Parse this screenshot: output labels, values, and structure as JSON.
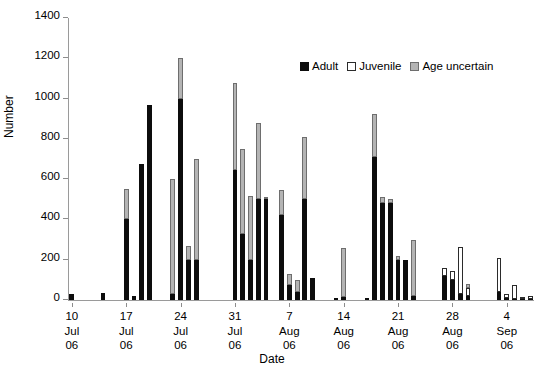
{
  "chart_data": {
    "type": "bar",
    "title": "",
    "subtitle": "",
    "xlabel": "Date",
    "ylabel": "Number",
    "ylim": [
      0,
      1400
    ],
    "ytick_step": 200,
    "yticks": [
      0,
      200,
      400,
      600,
      800,
      1000,
      1200,
      1400
    ],
    "grid": false,
    "stacked": true,
    "legend_position": "top-right-inside",
    "legend": [
      "Adult",
      "Juvenile",
      "Age uncertain"
    ],
    "colors": {
      "adult": "#0d0d0d",
      "juvenile": "#ffffff",
      "age_uncertain": "#b4b4b4",
      "outline": "#2b2b2b",
      "axis": "#9a9a9a"
    },
    "xtick_labels": [
      {
        "day": "10",
        "month": "Jul",
        "year": "06"
      },
      {
        "day": "17",
        "month": "Jul",
        "year": "06"
      },
      {
        "day": "24",
        "month": "Jul",
        "year": "06"
      },
      {
        "day": "31",
        "month": "Jul",
        "year": "06"
      },
      {
        "day": "7",
        "month": "Aug",
        "year": "06"
      },
      {
        "day": "14",
        "month": "Aug",
        "year": "06"
      },
      {
        "day": "21",
        "month": "Aug",
        "year": "06"
      },
      {
        "day": "28",
        "month": "Aug",
        "year": "06"
      },
      {
        "day": "4",
        "month": "Sep",
        "year": "06"
      }
    ],
    "xtick_indices": [
      0,
      7,
      14,
      21,
      28,
      35,
      42,
      49,
      56
    ],
    "series": [
      {
        "name": "Adult",
        "key": "adult"
      },
      {
        "name": "Juvenile",
        "key": "juvenile"
      },
      {
        "name": "Age uncertain",
        "key": "age_uncertain"
      }
    ],
    "categories": [
      "10 Jul",
      "11 Jul",
      "12 Jul",
      "13 Jul",
      "14 Jul",
      "15 Jul",
      "16 Jul",
      "17 Jul",
      "18 Jul",
      "19 Jul",
      "20 Jul",
      "21 Jul",
      "22 Jul",
      "23 Jul",
      "24 Jul",
      "25 Jul",
      "26 Jul",
      "27 Jul",
      "28 Jul",
      "29 Jul",
      "30 Jul",
      "31 Jul",
      "1 Aug",
      "2 Aug",
      "3 Aug",
      "4 Aug",
      "5 Aug",
      "6 Aug",
      "7 Aug",
      "8 Aug",
      "9 Aug",
      "10 Aug",
      "11 Aug",
      "12 Aug",
      "13 Aug",
      "14 Aug",
      "15 Aug",
      "16 Aug",
      "17 Aug",
      "18 Aug",
      "19 Aug",
      "20 Aug",
      "21 Aug",
      "22 Aug",
      "23 Aug",
      "24 Aug",
      "25 Aug",
      "26 Aug",
      "27 Aug",
      "28 Aug",
      "29 Aug",
      "30 Aug",
      "31 Aug",
      "1 Sep",
      "2 Sep",
      "3 Sep",
      "4 Sep",
      "5 Sep",
      "6 Sep"
    ],
    "bars": [
      {
        "x": "10 Jul",
        "adult": 30,
        "juvenile": 0,
        "age_uncertain": 0,
        "total": 30
      },
      {
        "x": "11 Jul",
        "adult": 0,
        "juvenile": 0,
        "age_uncertain": 0,
        "total": 0
      },
      {
        "x": "12 Jul",
        "adult": 0,
        "juvenile": 0,
        "age_uncertain": 0,
        "total": 0
      },
      {
        "x": "13 Jul",
        "adult": 0,
        "juvenile": 0,
        "age_uncertain": 0,
        "total": 0
      },
      {
        "x": "14 Jul",
        "adult": 35,
        "juvenile": 0,
        "age_uncertain": 0,
        "total": 35
      },
      {
        "x": "15 Jul",
        "adult": 0,
        "juvenile": 0,
        "age_uncertain": 0,
        "total": 0
      },
      {
        "x": "16 Jul",
        "adult": 0,
        "juvenile": 0,
        "age_uncertain": 0,
        "total": 0
      },
      {
        "x": "17 Jul",
        "adult": 400,
        "juvenile": 0,
        "age_uncertain": 150,
        "total": 550
      },
      {
        "x": "18 Jul",
        "adult": 20,
        "juvenile": 0,
        "age_uncertain": 0,
        "total": 20
      },
      {
        "x": "19 Jul",
        "adult": 675,
        "juvenile": 0,
        "age_uncertain": 0,
        "total": 675
      },
      {
        "x": "20 Jul",
        "adult": 970,
        "juvenile": 0,
        "age_uncertain": 0,
        "total": 970
      },
      {
        "x": "21 Jul",
        "adult": 0,
        "juvenile": 0,
        "age_uncertain": 0,
        "total": 0
      },
      {
        "x": "22 Jul",
        "adult": 0,
        "juvenile": 0,
        "age_uncertain": 0,
        "total": 0
      },
      {
        "x": "23 Jul",
        "adult": 30,
        "juvenile": 0,
        "age_uncertain": 570,
        "total": 600
      },
      {
        "x": "24 Jul",
        "adult": 1000,
        "juvenile": 0,
        "age_uncertain": 200,
        "total": 1200
      },
      {
        "x": "25 Jul",
        "adult": 200,
        "juvenile": 0,
        "age_uncertain": 70,
        "total": 270
      },
      {
        "x": "26 Jul",
        "adult": 200,
        "juvenile": 0,
        "age_uncertain": 500,
        "total": 700
      },
      {
        "x": "27 Jul",
        "adult": 0,
        "juvenile": 0,
        "age_uncertain": 0,
        "total": 0
      },
      {
        "x": "28 Jul",
        "adult": 0,
        "juvenile": 0,
        "age_uncertain": 0,
        "total": 0
      },
      {
        "x": "29 Jul",
        "adult": 0,
        "juvenile": 0,
        "age_uncertain": 0,
        "total": 0
      },
      {
        "x": "30 Jul",
        "adult": 0,
        "juvenile": 0,
        "age_uncertain": 0,
        "total": 0
      },
      {
        "x": "31 Jul",
        "adult": 645,
        "juvenile": 0,
        "age_uncertain": 430,
        "total": 1075
      },
      {
        "x": "1 Aug",
        "adult": 330,
        "juvenile": 0,
        "age_uncertain": 420,
        "total": 750
      },
      {
        "x": "2 Aug",
        "adult": 200,
        "juvenile": 0,
        "age_uncertain": 315,
        "total": 515
      },
      {
        "x": "3 Aug",
        "adult": 500,
        "juvenile": 0,
        "age_uncertain": 380,
        "total": 880
      },
      {
        "x": "4 Aug",
        "adult": 500,
        "juvenile": 0,
        "age_uncertain": 10,
        "total": 510
      },
      {
        "x": "5 Aug",
        "adult": 0,
        "juvenile": 0,
        "age_uncertain": 0,
        "total": 0
      },
      {
        "x": "6 Aug",
        "adult": 420,
        "juvenile": 0,
        "age_uncertain": 125,
        "total": 545
      },
      {
        "x": "7 Aug",
        "adult": 75,
        "juvenile": 0,
        "age_uncertain": 55,
        "total": 130
      },
      {
        "x": "8 Aug",
        "adult": 40,
        "juvenile": 0,
        "age_uncertain": 60,
        "total": 100
      },
      {
        "x": "9 Aug",
        "adult": 500,
        "juvenile": 0,
        "age_uncertain": 310,
        "total": 810
      },
      {
        "x": "10 Aug",
        "adult": 110,
        "juvenile": 0,
        "age_uncertain": 0,
        "total": 110
      },
      {
        "x": "11 Aug",
        "adult": 0,
        "juvenile": 0,
        "age_uncertain": 0,
        "total": 0
      },
      {
        "x": "12 Aug",
        "adult": 0,
        "juvenile": 0,
        "age_uncertain": 0,
        "total": 0
      },
      {
        "x": "13 Aug",
        "adult": 10,
        "juvenile": 0,
        "age_uncertain": 0,
        "total": 10
      },
      {
        "x": "14 Aug",
        "adult": 15,
        "juvenile": 0,
        "age_uncertain": 245,
        "total": 260
      },
      {
        "x": "15 Aug",
        "adult": 0,
        "juvenile": 0,
        "age_uncertain": 0,
        "total": 0
      },
      {
        "x": "16 Aug",
        "adult": 0,
        "juvenile": 0,
        "age_uncertain": 0,
        "total": 0
      },
      {
        "x": "17 Aug",
        "adult": 10,
        "juvenile": 0,
        "age_uncertain": 0,
        "total": 10
      },
      {
        "x": "18 Aug",
        "adult": 710,
        "juvenile": 0,
        "age_uncertain": 215,
        "total": 925
      },
      {
        "x": "19 Aug",
        "adult": 480,
        "juvenile": 0,
        "age_uncertain": 30,
        "total": 510
      },
      {
        "x": "20 Aug",
        "adult": 480,
        "juvenile": 0,
        "age_uncertain": 20,
        "total": 500
      },
      {
        "x": "21 Aug",
        "adult": 200,
        "juvenile": 0,
        "age_uncertain": 20,
        "total": 220
      },
      {
        "x": "22 Aug",
        "adult": 200,
        "juvenile": 0,
        "age_uncertain": 0,
        "total": 200
      },
      {
        "x": "23 Aug",
        "adult": 20,
        "juvenile": 0,
        "age_uncertain": 280,
        "total": 300
      },
      {
        "x": "24 Aug",
        "adult": 0,
        "juvenile": 0,
        "age_uncertain": 0,
        "total": 0
      },
      {
        "x": "25 Aug",
        "adult": 0,
        "juvenile": 0,
        "age_uncertain": 0,
        "total": 0
      },
      {
        "x": "26 Aug",
        "adult": 0,
        "juvenile": 0,
        "age_uncertain": 0,
        "total": 0
      },
      {
        "x": "27 Aug",
        "adult": 120,
        "juvenile": 40,
        "age_uncertain": 0,
        "total": 160
      },
      {
        "x": "28 Aug",
        "adult": 100,
        "juvenile": 45,
        "age_uncertain": 0,
        "total": 145
      },
      {
        "x": "29 Aug",
        "adult": 30,
        "juvenile": 235,
        "age_uncertain": 0,
        "total": 265
      },
      {
        "x": "30 Aug",
        "adult": 20,
        "juvenile": 40,
        "age_uncertain": 20,
        "total": 80
      },
      {
        "x": "31 Aug",
        "adult": 0,
        "juvenile": 0,
        "age_uncertain": 0,
        "total": 0
      },
      {
        "x": "1 Sep",
        "adult": 0,
        "juvenile": 0,
        "age_uncertain": 0,
        "total": 0
      },
      {
        "x": "2 Sep",
        "adult": 0,
        "juvenile": 0,
        "age_uncertain": 0,
        "total": 0
      },
      {
        "x": "3 Sep",
        "adult": 40,
        "juvenile": 170,
        "age_uncertain": 0,
        "total": 210
      },
      {
        "x": "4 Sep",
        "adult": 10,
        "juvenile": 20,
        "age_uncertain": 0,
        "total": 30
      },
      {
        "x": "5 Sep",
        "adult": 5,
        "juvenile": 70,
        "age_uncertain": 0,
        "total": 75
      },
      {
        "x": "6 Sep",
        "adult": 5,
        "juvenile": 10,
        "age_uncertain": 0,
        "total": 15
      },
      {
        "x": "7 Sep",
        "adult": 5,
        "juvenile": 15,
        "age_uncertain": 0,
        "total": 20
      }
    ]
  }
}
